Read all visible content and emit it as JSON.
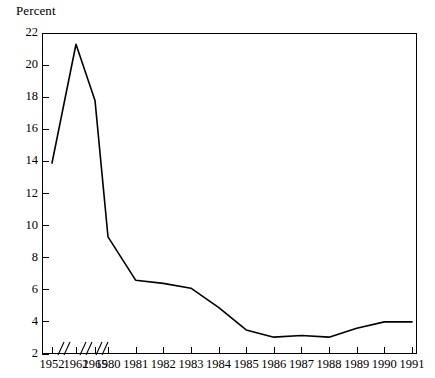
{
  "axis_title": "Percent",
  "chart_data": {
    "type": "line",
    "title": "",
    "subtitle": "",
    "xlabel": "",
    "ylabel": "Percent",
    "grid": false,
    "legend": "none",
    "axis_break_note": "x-axis has break marks between 1952/1962, 1962/1965 and 1965/1980 (non-uniform year spacing)",
    "categories": [
      "1952",
      "1962",
      "1965",
      "1980",
      "1981",
      "1982",
      "1983",
      "1984",
      "1985",
      "1986",
      "1987",
      "1988",
      "1989",
      "1990",
      "1991"
    ],
    "values": [
      13.9,
      21.3,
      17.8,
      9.3,
      6.6,
      6.4,
      6.1,
      4.9,
      3.5,
      3.05,
      3.15,
      3.05,
      3.6,
      4.0,
      4.0
    ],
    "ylim": [
      2,
      22
    ],
    "yticks": [
      2,
      4,
      6,
      8,
      10,
      12,
      14,
      16,
      18,
      20,
      22
    ],
    "ytick_labels": [
      "2",
      "4",
      "6",
      "8",
      "10",
      "12",
      "14",
      "16",
      "18",
      "20",
      "22"
    ],
    "xtick_labels": [
      "1952",
      "1962",
      "1965",
      "1980",
      "1981",
      "1982",
      "1983",
      "1984",
      "1985",
      "1986",
      "1987",
      "1988",
      "1989",
      "1990",
      "1991"
    ],
    "line_color": "#000000",
    "background_color": "#ffffff"
  }
}
